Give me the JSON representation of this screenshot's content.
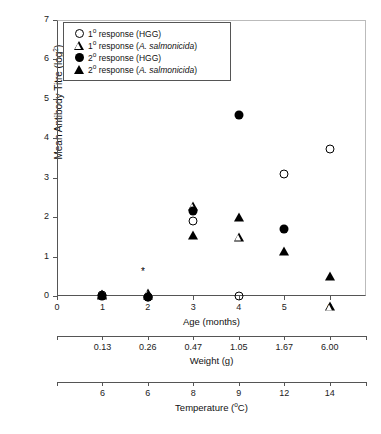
{
  "chart_data": {
    "type": "scatter",
    "title": "",
    "ylabel": "Mean Antibody Titre (log",
    "ylabel_sup": "2",
    "ylabel_close": ")",
    "ylim": [
      0,
      7
    ],
    "yticks": [
      0,
      1,
      2,
      3,
      4,
      5,
      6,
      7
    ],
    "xlabel": "Age (months)",
    "xlim": [
      0,
      6.8
    ],
    "xticks": [
      0,
      1,
      2,
      3,
      4,
      5,
      6
    ],
    "grid": false,
    "legend_position": "top-left",
    "secondary_axes": [
      {
        "name": "weight-axis",
        "label": "Weight (g)",
        "ticks": [
          "0.13",
          "0.26",
          "0.47",
          "1.05",
          "1.67",
          "6.00"
        ],
        "tick_positions": [
          1,
          2,
          3,
          4,
          5,
          6
        ]
      },
      {
        "name": "temperature-axis",
        "label": "Temperature (",
        "label_sup": "o",
        "label_close": "C)",
        "ticks": [
          "6",
          "6",
          "8",
          "9",
          "12",
          "14"
        ],
        "tick_positions": [
          1,
          2,
          3,
          4,
          5,
          6
        ]
      }
    ],
    "series": [
      {
        "name": "1° response (HGG)",
        "marker": "open-circle",
        "points": [
          {
            "x": 1,
            "y": 0.02
          },
          {
            "x": 2,
            "y": -0.02
          },
          {
            "x": 3,
            "y": 1.9
          },
          {
            "x": 4,
            "y": 0.0
          },
          {
            "x": 5,
            "y": 3.1
          },
          {
            "x": 6,
            "y": 3.73
          }
        ]
      },
      {
        "name": "1° response (A. salmonicida)",
        "marker": "open-triangle",
        "points": [
          {
            "x": 1,
            "y": 0.05
          },
          {
            "x": 2,
            "y": 0.3
          },
          {
            "x": 3,
            "y": 2.75
          },
          {
            "x": 4,
            "y": 2.18
          },
          {
            "x": 6,
            "y": 0.65
          }
        ]
      },
      {
        "name": "2° response (HGG)",
        "marker": "filled-circle",
        "points": [
          {
            "x": 1,
            "y": 0.0
          },
          {
            "x": 2,
            "y": -0.03
          },
          {
            "x": 3,
            "y": 2.15
          },
          {
            "x": 4,
            "y": 4.58
          },
          {
            "x": 5,
            "y": 1.7
          }
        ]
      },
      {
        "name": "2° response (A. salmonicida)",
        "marker": "filled-triangle",
        "points": [
          {
            "x": 1,
            "y": 0.02
          },
          {
            "x": 2,
            "y": 0.02
          },
          {
            "x": 3,
            "y": 1.55
          },
          {
            "x": 4,
            "y": 2.0
          },
          {
            "x": 5,
            "y": 1.15
          },
          {
            "x": 6,
            "y": 0.5
          }
        ]
      }
    ],
    "annotations": [
      {
        "name": "significance-asterisk",
        "text": "*",
        "x": 2,
        "y": 0.62
      }
    ]
  },
  "legend": {
    "items": [
      {
        "marker": "open-circle",
        "prefix": "1",
        "sup": "o",
        "text": " response (HGG)",
        "italic": ""
      },
      {
        "marker": "open-triangle",
        "prefix": "1",
        "sup": "o",
        "text": " response (",
        "italic": "A. salmonicida",
        "suffix": ")"
      },
      {
        "marker": "filled-circle",
        "prefix": "2",
        "sup": "o",
        "text": " response (HGG)",
        "italic": ""
      },
      {
        "marker": "filled-triangle",
        "prefix": "2",
        "sup": "o",
        "text": " response (",
        "italic": "A. salmonicida",
        "suffix": ")"
      }
    ]
  }
}
